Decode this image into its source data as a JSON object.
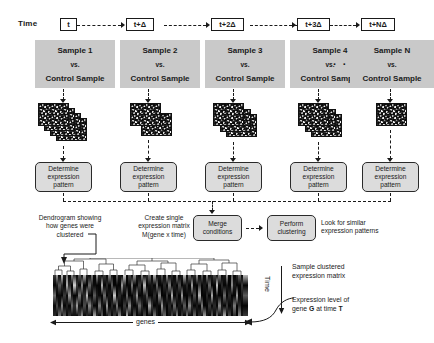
{
  "figure": {
    "time_axis_label": "Time",
    "timepoints": [
      {
        "id": "t0",
        "label": "t"
      },
      {
        "id": "t1",
        "label": "t+Δ"
      },
      {
        "id": "t2",
        "label": "t+2Δ"
      },
      {
        "id": "t3",
        "label": "t+3Δ"
      },
      {
        "id": "tn",
        "label": "t+NΔ"
      }
    ],
    "gap_ellipsis": "· · ·",
    "samples": [
      {
        "id": "s1",
        "title": "Sample 1",
        "vs": "vs.",
        "control": "Control Sample",
        "arrays": 4
      },
      {
        "id": "s2",
        "title": "Sample 2",
        "vs": "vs.",
        "control": "Control Sample",
        "arrays": 2
      },
      {
        "id": "s3",
        "title": "Sample 3",
        "vs": "vs.",
        "control": "Control Sample",
        "arrays": 3
      },
      {
        "id": "s4",
        "title": "Sample 4",
        "vs": "vs.",
        "control": "Control Sample",
        "arrays": 3
      },
      {
        "id": "sn",
        "title": "Sample N",
        "vs": "vs.",
        "control": "Control Sample",
        "arrays": 1
      }
    ],
    "determine_box": {
      "line1": "Determine",
      "line2": "expression",
      "line3": "pattern"
    },
    "pipeline": {
      "dendrogram_note": [
        "Dendrogram showing",
        "how genes were",
        "clustered"
      ],
      "create_matrix_note": [
        "Create single",
        "expression matrix",
        "M(gene x time)"
      ],
      "merge_box": [
        "Merge",
        "conditions"
      ],
      "cluster_box": [
        "Perform",
        "clustering"
      ],
      "look_note": [
        "Look for similar",
        "expression patterns"
      ]
    },
    "matrix": {
      "x_axis_label": "genes",
      "y_axis_label": "Time",
      "title_note": [
        "Sample clustered",
        "expression matrix"
      ],
      "callout": {
        "line1": "Expression level of",
        "line2_pre": "gene ",
        "line2_gene": "G",
        "line2_mid": " at time ",
        "line2_time": "T"
      }
    },
    "colors": {
      "sample_box_fill": "#c9c9c9",
      "process_box_fill": "#dcdcdc",
      "stroke": "#1a1a1a",
      "heatmap_bg": "#000000"
    }
  }
}
